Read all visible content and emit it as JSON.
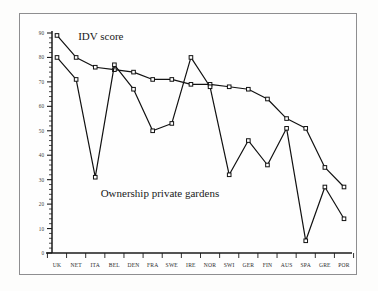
{
  "chart_data": {
    "type": "line",
    "title": "",
    "subtitle": "",
    "xlabel": "",
    "ylabel": "",
    "ylim": [
      0,
      90
    ],
    "grid": false,
    "legend_position": "inline-annotation",
    "y_ticks": [
      0,
      10,
      20,
      30,
      40,
      50,
      60,
      70,
      80,
      90
    ],
    "y_tick_labels": [
      "0",
      "10",
      "20",
      "30",
      "40",
      "50",
      "60",
      "70",
      "80",
      "90"
    ],
    "y_minor_tick_step": 2,
    "categories": [
      "UK",
      "NET",
      "ITA",
      "BEL",
      "DEN",
      "FRA",
      "SWE",
      "IRE",
      "NOR",
      "SWI",
      "GER",
      "FIN",
      "AUS",
      "SPA",
      "GRE",
      "POR"
    ],
    "series": [
      {
        "name": "IDV score",
        "marker": "open-square",
        "values": [
          89,
          80,
          76,
          75,
          74,
          71,
          71,
          69,
          69,
          68,
          67,
          63,
          55,
          51,
          35,
          27
        ]
      },
      {
        "name": "Ownership private gardens",
        "marker": "open-square",
        "values": [
          80,
          71,
          31,
          77,
          67,
          50,
          53,
          80,
          68,
          32,
          46,
          36,
          51,
          5,
          27,
          14
        ]
      }
    ],
    "annotations": [
      {
        "text": "IDV score",
        "x_category": "NET",
        "y_value": 87
      },
      {
        "text": "Ownership private gardens",
        "x_category": "FRA",
        "y_value": 23
      }
    ]
  },
  "annotations": {
    "idv_label": "IDV score",
    "ownership_label": "Ownership private gardens"
  },
  "axes": {
    "y_tick_labels": [
      "90",
      "80",
      "70",
      "60",
      "50",
      "40",
      "30",
      "20",
      "10",
      "0"
    ],
    "x_tick_labels": [
      "UK",
      "NET",
      "ITA",
      "BEL",
      "DEN",
      "FRA",
      "SWE",
      "IRE",
      "NOR",
      "SWI",
      "GER",
      "FIN",
      "AUS",
      "SPA",
      "GRE",
      "POR"
    ]
  },
  "colors": {
    "ink": "#111111",
    "paper": "#fefefe",
    "frame": "#8e8e90",
    "tick_text": "#3a3a3a"
  }
}
